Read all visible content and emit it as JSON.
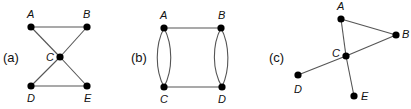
{
  "figure": {
    "graphs": [
      {
        "id": "a",
        "label": "(a)",
        "vertices": [
          "A",
          "B",
          "C",
          "D",
          "E"
        ],
        "edges": [
          [
            "A",
            "B"
          ],
          [
            "A",
            "C"
          ],
          [
            "B",
            "C"
          ],
          [
            "C",
            "D"
          ],
          [
            "C",
            "E"
          ],
          [
            "D",
            "E"
          ]
        ]
      },
      {
        "id": "b",
        "label": "(b)",
        "vertices": [
          "A",
          "B",
          "C",
          "D"
        ],
        "edges": [
          [
            "A",
            "B"
          ],
          [
            "C",
            "D"
          ],
          [
            "A",
            "C"
          ],
          [
            "A",
            "C"
          ],
          [
            "B",
            "D"
          ],
          [
            "B",
            "D"
          ]
        ]
      },
      {
        "id": "c",
        "label": "(c)",
        "vertices": [
          "A",
          "B",
          "C",
          "D",
          "E"
        ],
        "edges": [
          [
            "A",
            "B"
          ],
          [
            "A",
            "C"
          ],
          [
            "C",
            "E"
          ],
          [
            "B",
            "C"
          ],
          [
            "C",
            "D"
          ]
        ]
      }
    ]
  }
}
